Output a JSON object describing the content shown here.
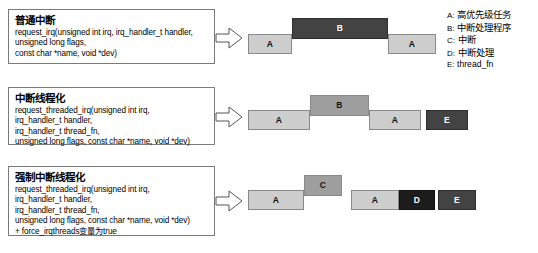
{
  "boxes": [
    {
      "title": "普通中断",
      "lines": [
        "request_irq(unsigned int irq, irq_handler_t handler,",
        "unsigned long flags,",
        "const char *name, void *dev)"
      ]
    },
    {
      "title": "中断线程化",
      "lines": [
        "request_threaded_irq(unsigned int irq,",
        "irq_handler_t handler,",
        "irq_handler_t thread_fn,",
        "unsigned long flags, const char *name, void *dev)"
      ]
    },
    {
      "title": "强制中断线程化",
      "lines": [
        "request_threaded_irq(unsigned int irq,",
        "irq_handler_t handler,",
        "irq_handler_t thread_fn,",
        "unsigned long flags, const char *name, void *dev)",
        "+ force_irqthreads变量为true"
      ]
    }
  ],
  "timelines": [
    {
      "name": "普通中断时序",
      "blocks": [
        {
          "label": "A",
          "tone": "light",
          "left": 0,
          "width": 44,
          "top": 26,
          "height": 20
        },
        {
          "label": "B",
          "tone": "dark",
          "left": 44,
          "width": 96,
          "top": 10,
          "height": 21
        },
        {
          "label": "A",
          "tone": "light",
          "left": 140,
          "width": 48,
          "top": 26,
          "height": 20
        }
      ]
    },
    {
      "name": "中断线程化时序",
      "blocks": [
        {
          "label": "A",
          "tone": "light",
          "left": 0,
          "width": 62,
          "top": 24,
          "height": 20
        },
        {
          "label": "B",
          "tone": "mid",
          "left": 62,
          "width": 59,
          "top": 9,
          "height": 21
        },
        {
          "label": "A",
          "tone": "light",
          "left": 121,
          "width": 52,
          "top": 24,
          "height": 20
        },
        {
          "label": "E",
          "tone": "dark",
          "left": 178,
          "width": 42,
          "top": 24,
          "height": 20
        }
      ]
    },
    {
      "name": "强制中断线程化时序",
      "blocks": [
        {
          "label": "A",
          "tone": "light",
          "left": 0,
          "width": 56,
          "top": 24,
          "height": 20
        },
        {
          "label": "C",
          "tone": "mid",
          "left": 56,
          "width": 38,
          "top": 9,
          "height": 21
        },
        {
          "label": "A",
          "tone": "light",
          "left": 103,
          "width": 48,
          "top": 24,
          "height": 20
        },
        {
          "label": "D",
          "tone": "black",
          "left": 151,
          "width": 36,
          "top": 24,
          "height": 20
        },
        {
          "label": "E",
          "tone": "dark",
          "left": 190,
          "width": 38,
          "top": 24,
          "height": 20
        }
      ]
    }
  ],
  "legend": [
    {
      "key": "A:",
      "value": "高优先级任务",
      "mono": false
    },
    {
      "key": "B:",
      "value": "中断处理程序",
      "mono": false
    },
    {
      "key": "C:",
      "value": "中断",
      "mono": false
    },
    {
      "key": "D:",
      "value": "中断处理",
      "mono": false
    },
    {
      "key": "E:",
      "value": "thread_fn",
      "mono": true
    }
  ],
  "colors": {
    "light_block": "#cdcdcd",
    "mid_block": "#9e9e9e",
    "dark_block": "#434343",
    "black_block": "#1c1c1c",
    "box_border": "#7a7a7a",
    "background": "#ffffff"
  }
}
